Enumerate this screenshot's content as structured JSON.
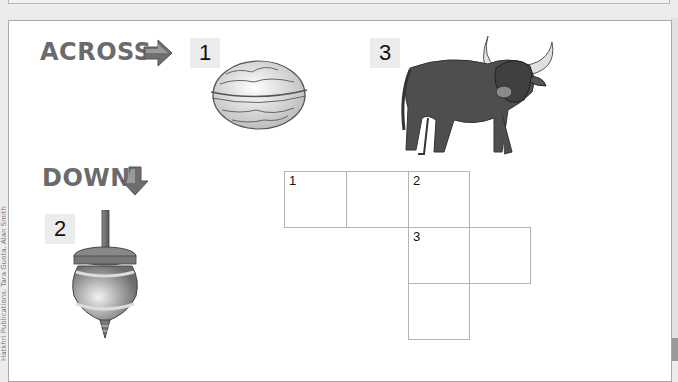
{
  "worksheet": {
    "across_heading": "ACROSS",
    "down_heading": "DOWN",
    "side_text": "Hatkhri Publications, Tara Gupta, Alan Smith"
  },
  "clues": {
    "across": [
      {
        "number": "1",
        "picture": "walnut"
      },
      {
        "number": "3",
        "picture": "buffalo"
      }
    ],
    "down": [
      {
        "number": "2",
        "picture": "spinning top"
      }
    ]
  },
  "crossword": {
    "cells": [
      {
        "row": 0,
        "col": 0,
        "label": "1"
      },
      {
        "row": 0,
        "col": 1,
        "label": ""
      },
      {
        "row": 0,
        "col": 2,
        "label": "2"
      },
      {
        "row": 1,
        "col": 2,
        "label": "3"
      },
      {
        "row": 1,
        "col": 3,
        "label": ""
      },
      {
        "row": 2,
        "col": 2,
        "label": ""
      }
    ]
  },
  "colors": {
    "heading": "#6b6b6b",
    "badge_bg": "#ececec",
    "grid_line": "#b4b4b4",
    "page_bg": "#ececec"
  }
}
